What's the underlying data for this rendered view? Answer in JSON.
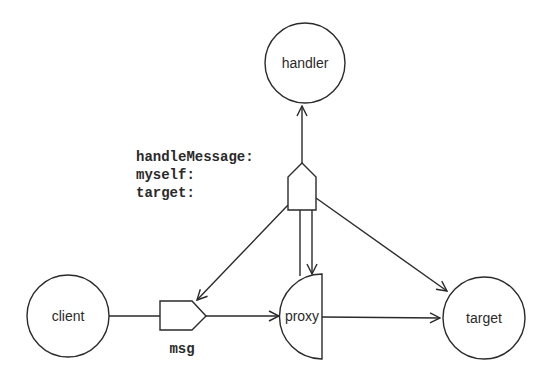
{
  "diagram": {
    "nodes": {
      "handler": {
        "label": "handler",
        "shape": "circle"
      },
      "client": {
        "label": "client",
        "shape": "circle"
      },
      "proxy": {
        "label": "proxy",
        "shape": "half-circle"
      },
      "target": {
        "label": "target",
        "shape": "circle"
      }
    },
    "messages": {
      "msg": {
        "label": "msg",
        "shape": "message-pentagon-right"
      },
      "handle_message": {
        "shape": "message-pentagon-up",
        "selector_lines": [
          "handleMessage:",
          "myself:",
          "target:"
        ]
      }
    },
    "edges": [
      {
        "from": "client",
        "to": "proxy",
        "via": "msg"
      },
      {
        "from": "proxy",
        "to": "target"
      },
      {
        "from": "proxy",
        "to": "handle_message"
      },
      {
        "from": "handle_message",
        "to": "handler"
      },
      {
        "from": "handle_message",
        "to": "msg"
      },
      {
        "from": "handle_message",
        "to": "proxy"
      },
      {
        "from": "handle_message",
        "to": "target"
      }
    ],
    "colors": {
      "line": "#2a2a2a",
      "background": "#ffffff"
    }
  }
}
